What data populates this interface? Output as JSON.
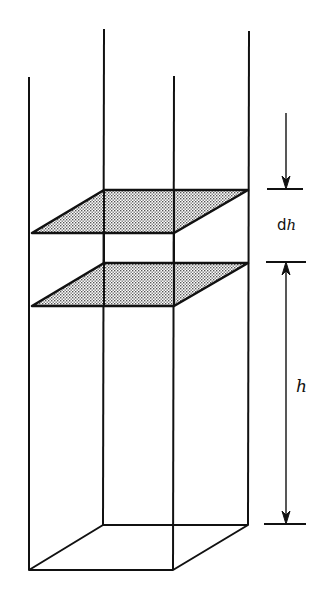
{
  "diagram": {
    "labels": {
      "dh_prefix": "d",
      "dh_var": "h",
      "height": "h"
    },
    "colors": {
      "stroke": "#111111",
      "slab_fill": "#c8c8c8",
      "background": "#ffffff"
    }
  }
}
